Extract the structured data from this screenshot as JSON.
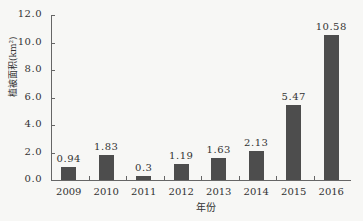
{
  "chart_data": {
    "type": "bar",
    "title": "",
    "xlabel": "年份",
    "ylabel": "植被面积(km²)",
    "categories": [
      "2009",
      "2010",
      "2011",
      "2012",
      "2013",
      "2014",
      "2015",
      "2016"
    ],
    "values": [
      0.94,
      1.83,
      0.3,
      1.19,
      1.63,
      2.13,
      5.47,
      10.58
    ],
    "value_labels": [
      "0.94",
      "1.83",
      "0.3",
      "1.19",
      "1.63",
      "2.13",
      "5.47",
      "10.58"
    ],
    "ylim": [
      0,
      12
    ],
    "yticks": [
      "0.0",
      "2.0",
      "4.0",
      "6.0",
      "8.0",
      "10.0",
      "12.0"
    ],
    "grid": false,
    "legend": "none",
    "bar_color": "#4d4d4d"
  }
}
